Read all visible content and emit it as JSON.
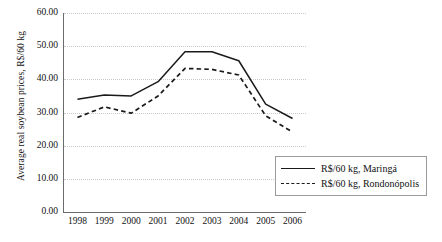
{
  "chart_data": {
    "type": "line",
    "title": "",
    "xlabel": "",
    "ylabel": "Average real soybean prices, R$/60 kg",
    "categories": [
      "1998",
      "1999",
      "2000",
      "2001",
      "2002",
      "2003",
      "2004",
      "2005",
      "2006"
    ],
    "ylim": [
      0,
      60
    ],
    "ytick_labels": [
      "60.00",
      "50.00",
      "40.00",
      "30.00",
      "20.00",
      "10.00",
      "0.00"
    ],
    "ytick_values": [
      60,
      50,
      40,
      30,
      20,
      10,
      0
    ],
    "grid": true,
    "legend_position": "bottom-right",
    "series": [
      {
        "name": "R$/60 kg, Maringá",
        "style": "solid",
        "color": "#1a1a1a",
        "values": [
          34.0,
          35.3,
          35.0,
          39.3,
          48.3,
          48.3,
          45.6,
          32.5,
          28.2
        ]
      },
      {
        "name": "R$/60 kg, Rondonópolis",
        "style": "dashed",
        "color": "#1a1a1a",
        "values": [
          28.5,
          31.7,
          29.8,
          35.0,
          43.3,
          43.0,
          41.3,
          29.0,
          24.1
        ]
      }
    ]
  }
}
